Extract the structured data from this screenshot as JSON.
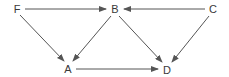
{
  "diagram": {
    "type": "directed-graph",
    "colors": {
      "background": "#ffffff",
      "edge": "#555555",
      "text": "#3a3a3a"
    },
    "nodes": [
      {
        "id": "F",
        "label": "F",
        "x": 17,
        "y": 9
      },
      {
        "id": "B",
        "label": "B",
        "x": 115,
        "y": 9
      },
      {
        "id": "C",
        "label": "C",
        "x": 213,
        "y": 9
      },
      {
        "id": "A",
        "label": "A",
        "x": 68,
        "y": 69
      },
      {
        "id": "D",
        "label": "D",
        "x": 167,
        "y": 70
      }
    ],
    "edges": [
      {
        "from": "F",
        "to": "B"
      },
      {
        "from": "C",
        "to": "B"
      },
      {
        "from": "F",
        "to": "A"
      },
      {
        "from": "B",
        "to": "A"
      },
      {
        "from": "B",
        "to": "D"
      },
      {
        "from": "C",
        "to": "D"
      },
      {
        "from": "A",
        "to": "D"
      }
    ]
  }
}
